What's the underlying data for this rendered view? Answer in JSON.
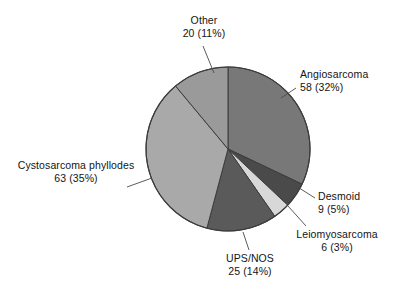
{
  "chart_data": {
    "type": "pie",
    "title": "",
    "subtitle": "",
    "xlabel": "",
    "ylabel": "",
    "legend_position": "none",
    "grid": false,
    "total": 181,
    "units": "cases",
    "start_angle_deg": 0,
    "direction": "clockwise",
    "categories": [
      "Angiosarcoma",
      "Desmoid",
      "Leiomyosarcoma",
      "UPS/NOS",
      "Cystosarcoma phyllodes",
      "Other"
    ],
    "values": [
      58,
      9,
      6,
      25,
      63,
      20
    ],
    "percentages": [
      32,
      5,
      3,
      14,
      35,
      11
    ],
    "colors": [
      "#787878",
      "#4a4a4a",
      "#d8d8d8",
      "#5a5a5a",
      "#a9a9a9",
      "#9a9a9a"
    ],
    "slices": [
      {
        "name": "Angiosarcoma",
        "value": 58,
        "percent": 32,
        "label_line1": "Angiosarcoma",
        "label_line2": "58 (32%)",
        "color": "#787878"
      },
      {
        "name": "Desmoid",
        "value": 9,
        "percent": 5,
        "label_line1": "Desmoid",
        "label_line2": "9 (5%)",
        "color": "#4a4a4a"
      },
      {
        "name": "Leiomyosarcoma",
        "value": 6,
        "percent": 3,
        "label_line1": "Leiomyosarcoma",
        "label_line2": "6 (3%)",
        "color": "#d8d8d8"
      },
      {
        "name": "UPS/NOS",
        "value": 25,
        "percent": 14,
        "label_line1": "UPS/NOS",
        "label_line2": "25 (14%)",
        "color": "#5a5a5a"
      },
      {
        "name": "Cystosarcoma phyllodes",
        "value": 63,
        "percent": 35,
        "label_line1": "Cystosarcoma phyllodes",
        "label_line2": "63 (35%)",
        "color": "#a9a9a9"
      },
      {
        "name": "Other",
        "value": 20,
        "percent": 11,
        "label_line1": "Other",
        "label_line2": "20 (11%)",
        "color": "#9a9a9a"
      }
    ]
  },
  "figure": {
    "background": "#ffffff",
    "outline_color": "#3c3c3c",
    "leader_line_color": "#4a4a4a"
  }
}
